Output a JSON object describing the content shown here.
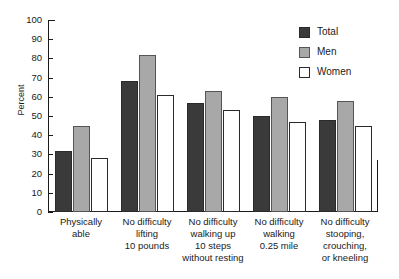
{
  "chart_data": {
    "type": "bar",
    "title": "",
    "xlabel": "",
    "ylabel": "Percent",
    "ylim": [
      0,
      100
    ],
    "yticks": [
      0,
      10,
      20,
      30,
      40,
      50,
      60,
      70,
      80,
      90,
      100
    ],
    "grid": false,
    "legend_position": "top-right",
    "categories": [
      "Physically able",
      "No difficulty lifting 10 pounds",
      "No difficulty walking up 10 steps without resting",
      "No difficulty walking 0.25 mile",
      "No difficulty stooping, crouching, or kneeling"
    ],
    "category_lines": [
      [
        "Physically",
        "able"
      ],
      [
        "No difficulty",
        "lifting",
        "10 pounds"
      ],
      [
        "No difficulty",
        "walking up",
        "10 steps",
        "without resting"
      ],
      [
        "No difficulty",
        "walking",
        "0.25 mile"
      ],
      [
        "No difficulty",
        "stooping,",
        "crouching,",
        "or kneeling"
      ]
    ],
    "series": [
      {
        "name": "Total",
        "color": "#3a3a3a",
        "values": [
          32,
          68,
          57,
          50,
          48
        ]
      },
      {
        "name": "Men",
        "color": "#a8a8a8",
        "values": [
          45,
          82,
          63,
          60,
          58
        ]
      },
      {
        "name": "Women",
        "color": "#ffffff",
        "values": [
          28,
          61,
          53,
          47,
          45
        ]
      }
    ]
  }
}
